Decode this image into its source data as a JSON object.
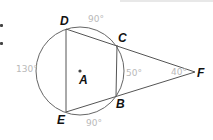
{
  "diagram": {
    "type": "geometry",
    "circle": {
      "center_label": "A"
    },
    "points": [
      {
        "label": "D",
        "x": 66,
        "y": 29
      },
      {
        "label": "C",
        "x": 117,
        "y": 45
      },
      {
        "label": "B",
        "x": 116,
        "y": 96
      },
      {
        "label": "E",
        "x": 66,
        "y": 112
      },
      {
        "label": "F",
        "x": 195,
        "y": 72
      },
      {
        "label": "A",
        "x": 80,
        "y": 71
      }
    ],
    "annotations": [
      {
        "id": "arc-dc",
        "text": "90°"
      },
      {
        "id": "arc-de",
        "text": "130°"
      },
      {
        "id": "arc-cb",
        "text": "50°"
      },
      {
        "id": "arc-eb",
        "text": "90°"
      },
      {
        "id": "angle-f",
        "text": "40°"
      }
    ]
  }
}
